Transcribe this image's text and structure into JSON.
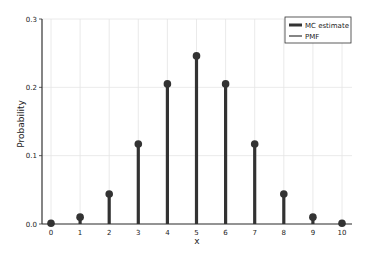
{
  "chart_data": {
    "type": "stem",
    "title": "",
    "xlabel": "x",
    "ylabel": "Probability",
    "x": [
      0,
      1,
      2,
      3,
      4,
      5,
      6,
      7,
      8,
      9,
      10
    ],
    "series": [
      {
        "name": "MC estimate",
        "values": [
          0.001,
          0.01,
          0.044,
          0.117,
          0.205,
          0.246,
          0.205,
          0.117,
          0.044,
          0.01,
          0.001
        ]
      },
      {
        "name": "PMF",
        "values": [
          0.001,
          0.01,
          0.044,
          0.117,
          0.205,
          0.246,
          0.205,
          0.117,
          0.044,
          0.01,
          0.001
        ]
      }
    ],
    "xticks": [
      "0",
      "1",
      "2",
      "3",
      "4",
      "5",
      "6",
      "7",
      "8",
      "9",
      "10"
    ],
    "yticks": [
      "0.0",
      "0.1",
      "0.2",
      "0.3"
    ],
    "ylim": [
      0,
      0.3
    ],
    "xlim": [
      -0.3,
      10.3
    ],
    "grid": true,
    "legend_position": "upper right",
    "colors": {
      "stem": "#333333",
      "grid": "#e4e4e4",
      "axis": "#333333"
    }
  },
  "legend": {
    "items": [
      "MC estimate",
      "PMF"
    ]
  }
}
